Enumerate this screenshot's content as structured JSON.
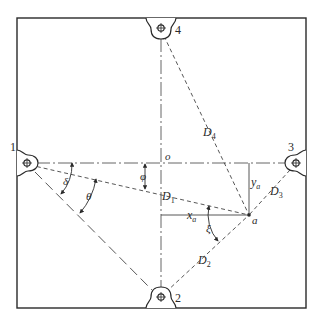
{
  "diagram": {
    "type": "sensor-layout",
    "frame": {
      "x1": 17,
      "y1": 18,
      "x2": 306,
      "y2": 308
    },
    "colors": {
      "stroke": "#2a2a2a",
      "background": "#ffffff"
    },
    "nodes": [
      {
        "id": "1",
        "label": "1",
        "x": 27,
        "y": 163
      },
      {
        "id": "2",
        "label": "2",
        "x": 161,
        "y": 298
      },
      {
        "id": "3",
        "label": "3",
        "x": 296,
        "y": 163
      },
      {
        "id": "4",
        "label": "4",
        "x": 161,
        "y": 29
      }
    ],
    "origin": {
      "label": "o",
      "x": 161,
      "y": 163
    },
    "point": {
      "label": "a",
      "x": 249,
      "y": 215
    },
    "distances": [
      {
        "name": "D1",
        "base": "D",
        "sub": "1",
        "from": "1",
        "to": "a"
      },
      {
        "name": "D2",
        "base": "D",
        "sub": "2",
        "from": "2",
        "to": "a"
      },
      {
        "name": "D3",
        "base": "D",
        "sub": "3",
        "from": "3",
        "to": "a"
      },
      {
        "name": "D4",
        "base": "D",
        "sub": "4",
        "from": "4",
        "to": "a"
      }
    ],
    "coordinates": [
      {
        "name": "xa",
        "base": "x",
        "sub": "a"
      },
      {
        "name": "ya",
        "base": "y",
        "sub": "a"
      }
    ],
    "angles": [
      {
        "name": "delta",
        "symbol": "δ"
      },
      {
        "name": "theta",
        "symbol": "θ"
      },
      {
        "name": "phi",
        "symbol": "φ"
      },
      {
        "name": "xi",
        "symbol": "ξ"
      }
    ]
  },
  "labels": {
    "n1": "1",
    "n2": "2",
    "n3": "3",
    "n4": "4",
    "o": "o",
    "a": "a",
    "D": "D",
    "d1sub": "1",
    "d2sub": "2",
    "d3sub": "3",
    "d4sub": "4",
    "x": "x",
    "y": "y",
    "asub": "a",
    "delta": "δ",
    "theta": "θ",
    "phi": "φ",
    "xi": "ξ"
  }
}
